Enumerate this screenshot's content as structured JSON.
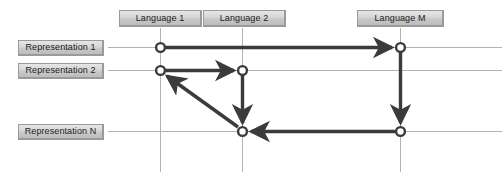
{
  "diagram": {
    "type": "node-link-grid",
    "background_color": "#ffffff",
    "gridline_color": "#b0b0b0",
    "edge_color": "#3b3b3b",
    "node_fill": "#ffffff",
    "node_stroke": "#3b3b3b",
    "chip_fill": "#d4d4d4",
    "chip_border": "#9a9a9a"
  },
  "columns": [
    {
      "id": "lang1",
      "label": "Language 1",
      "x": 160,
      "chip_left": 119,
      "chip_width": 83
    },
    {
      "id": "lang2",
      "label": "Language 2",
      "x": 242,
      "chip_left": 203,
      "chip_width": 83
    },
    {
      "id": "langM",
      "label": "Language M",
      "x": 400,
      "chip_left": 357,
      "chip_width": 87
    }
  ],
  "rows": [
    {
      "id": "rep1",
      "label": "Representation 1",
      "y": 47,
      "chip_left": 18,
      "chip_width": 86
    },
    {
      "id": "rep2",
      "label": "Representation 2",
      "y": 70,
      "chip_left": 18,
      "chip_width": 86
    },
    {
      "id": "repN",
      "label": "Representation N",
      "y": 131,
      "chip_left": 18,
      "chip_width": 86
    }
  ],
  "nodes": [
    {
      "id": "n-r1-l1",
      "row": "rep1",
      "column": "lang1",
      "x": 160,
      "y": 47
    },
    {
      "id": "n-r1-lM",
      "row": "rep1",
      "column": "langM",
      "x": 400,
      "y": 47
    },
    {
      "id": "n-r2-l1",
      "row": "rep2",
      "column": "lang1",
      "x": 160,
      "y": 70
    },
    {
      "id": "n-r2-l2",
      "row": "rep2",
      "column": "lang2",
      "x": 242,
      "y": 70
    },
    {
      "id": "n-rN-l2",
      "row": "repN",
      "column": "lang2",
      "x": 242,
      "y": 131
    },
    {
      "id": "n-rN-lM",
      "row": "repN",
      "column": "langM",
      "x": 400,
      "y": 131
    }
  ],
  "edges": [
    {
      "id": "e1",
      "from": "n-r1-l1",
      "to": "n-r1-lM",
      "direction": "right"
    },
    {
      "id": "e2",
      "from": "n-r2-l1",
      "to": "n-r2-l2",
      "direction": "right"
    },
    {
      "id": "e3",
      "from": "n-r2-l2",
      "to": "n-rN-l2",
      "direction": "down"
    },
    {
      "id": "e4",
      "from": "n-r1-lM",
      "to": "n-rN-lM",
      "direction": "down"
    },
    {
      "id": "e5",
      "from": "n-rN-lM",
      "to": "n-rN-l2",
      "direction": "left"
    },
    {
      "id": "e6",
      "from": "n-rN-l2",
      "to": "n-r2-l1",
      "direction": "up-left-diagonal"
    }
  ],
  "gridlines": {
    "horizontal_y": [
      47,
      70,
      131
    ],
    "horizontal_x_start": 108,
    "horizontal_x_end": 502,
    "vertical_x": [
      160,
      242,
      400
    ],
    "vertical_y_start": 28,
    "vertical_y_end": 172
  }
}
